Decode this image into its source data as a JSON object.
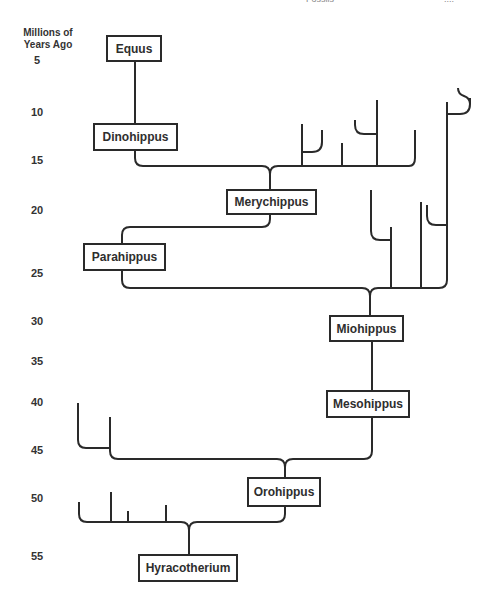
{
  "header_fragments": [
    "Fossils",
    "...."
  ],
  "axis": {
    "title": "Millions of Years Ago",
    "ticks": [
      "5",
      "10",
      "15",
      "20",
      "25",
      "30",
      "35",
      "40",
      "45",
      "50",
      "55"
    ]
  },
  "nodes": {
    "equus": "Equus",
    "dinohippus": "Dinohippus",
    "merychippus": "Merychippus",
    "parahippus": "Parahippus",
    "miohippus": "Miohippus",
    "mesohippus": "Mesohippus",
    "orohippus": "Orohippus",
    "hyracotherium": "Hyracotherium"
  },
  "colors": {
    "line": "#2a2a2a",
    "text": "#2e2e2e",
    "background": "#ffffff"
  }
}
